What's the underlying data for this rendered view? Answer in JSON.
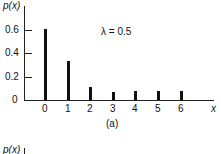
{
  "chart_data": {
    "type": "bar",
    "subtype": "stem",
    "title": "",
    "caption": "(a)",
    "annotation": "λ = 0.5",
    "xlabel": "x",
    "ylabel": "p(x)",
    "categories": [
      "0",
      "1",
      "2",
      "3",
      "4",
      "5",
      "6"
    ],
    "values": [
      0.61,
      0.33,
      0.11,
      0.07,
      0.08,
      0.08,
      0.08
    ],
    "yticks": [
      "0",
      "0.2",
      "0.4",
      "0.6"
    ],
    "ylim": [
      0,
      0.65
    ],
    "grid": false,
    "legend": "none",
    "bar_color": "#111111"
  },
  "second_chart": {
    "ylabel": "p(x)"
  }
}
